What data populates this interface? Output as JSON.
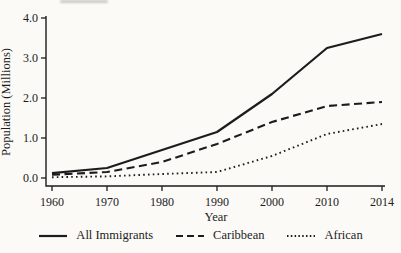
{
  "figure": {
    "background_color": "#fbfaf7",
    "ink_color": "#1c1c1c"
  },
  "chart_data": {
    "type": "line",
    "title": "",
    "xlabel": "Year",
    "ylabel": "Population (Millions)",
    "categories": [
      "1960",
      "1970",
      "1980",
      "1990",
      "2000",
      "2010",
      "2014"
    ],
    "series": [
      {
        "name": "All Immigrants",
        "style": "solid",
        "values": [
          0.12,
          0.25,
          0.7,
          1.15,
          2.1,
          3.25,
          3.6
        ]
      },
      {
        "name": "Caribbean",
        "style": "dashed",
        "values": [
          0.08,
          0.15,
          0.4,
          0.85,
          1.4,
          1.8,
          1.9
        ]
      },
      {
        "name": "African",
        "style": "dotted",
        "values": [
          0.02,
          0.04,
          0.1,
          0.15,
          0.55,
          1.1,
          1.35
        ]
      }
    ],
    "ylim": [
      0,
      4
    ],
    "yticks": [
      0,
      1,
      2,
      3,
      4
    ],
    "ytick_labels": [
      "0.0",
      "1.0",
      "2.0",
      "3.0",
      "4.0"
    ],
    "grid": "off",
    "legend_position": "bottom",
    "line_color": "#1c1c1c"
  }
}
